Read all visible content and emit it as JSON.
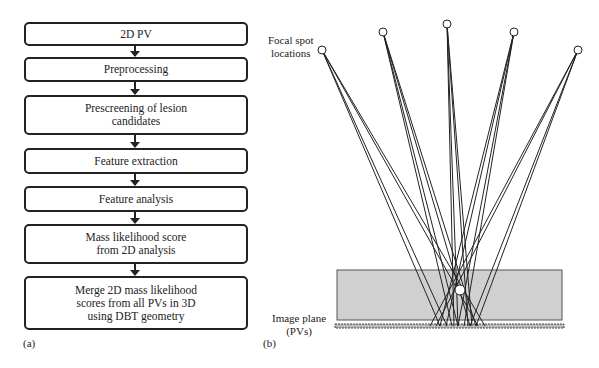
{
  "panel_a": {
    "label": "(a)",
    "steps": [
      {
        "text": "2D PV"
      },
      {
        "text": "Preprocessing"
      },
      {
        "text": "Prescreening of lesion\ncandidates"
      },
      {
        "text": "Feature extraction"
      },
      {
        "text": "Feature analysis"
      },
      {
        "text": "Mass likelihood score\nfrom 2D analysis"
      },
      {
        "text": "Merge 2D mass likelihood\nscores from all PVs in 3D\nusing DBT geometry"
      }
    ]
  },
  "panel_b": {
    "label": "(b)",
    "focal_spot_label": "Focal spot\nlocations",
    "image_plane_label": "Image plane\n(PVs)",
    "focal_spots": [
      [
        322,
        50
      ],
      [
        383,
        32
      ],
      [
        447,
        24
      ],
      [
        514,
        32
      ],
      [
        578,
        50
      ]
    ],
    "lesion": [
      460,
      290
    ],
    "colors": {
      "breast": "#d0d0d0",
      "lines": "#222222"
    }
  }
}
